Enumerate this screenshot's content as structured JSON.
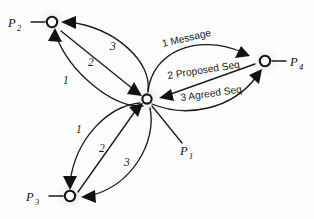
{
  "figure": {
    "background_color": "#fefefe",
    "stroke_color": "#1a1a1a",
    "node_fill_color": "#ffffff",
    "glow_color": "#d0d0d0"
  },
  "nodes": [
    {
      "id": "p1",
      "label": "P",
      "subscript": "1",
      "x": 147,
      "y": 99,
      "label_x": 186,
      "label_y": 152,
      "role": "sender-hub"
    },
    {
      "id": "p2",
      "label": "P",
      "subscript": "2",
      "x": 52,
      "y": 22,
      "label_x": 14,
      "label_y": 26,
      "role": "receiver"
    },
    {
      "id": "p3",
      "label": "P",
      "subscript": "3",
      "x": 70,
      "y": 196,
      "label_x": 32,
      "label_y": 200,
      "role": "receiver"
    },
    {
      "id": "p4",
      "label": "P",
      "subscript": "4",
      "x": 265,
      "y": 61,
      "label_x": 290,
      "label_y": 65,
      "role": "receiver"
    }
  ],
  "edges": [
    {
      "id": "e-p2-1",
      "label": "1",
      "from": "p1",
      "to": "p2",
      "label_x": 63,
      "label_y": 80,
      "group": "upper-left"
    },
    {
      "id": "e-p2-2",
      "label": "2",
      "from": "p2",
      "to": "p1",
      "label_x": 90,
      "label_y": 62,
      "group": "upper-left"
    },
    {
      "id": "e-p2-3",
      "label": "3",
      "from": "p1",
      "to": "p2",
      "label_x": 112,
      "label_y": 46,
      "group": "upper-left"
    },
    {
      "id": "e-p3-1",
      "label": "1",
      "from": "p1",
      "to": "p3",
      "label_x": 78,
      "label_y": 129,
      "group": "lower-left"
    },
    {
      "id": "e-p3-2",
      "label": "2",
      "from": "p3",
      "to": "p1",
      "label_x": 101,
      "label_y": 148,
      "group": "lower-left"
    },
    {
      "id": "e-p3-3",
      "label": "3",
      "from": "p1",
      "to": "p3",
      "label_x": 126,
      "label_y": 162,
      "group": "lower-left"
    },
    {
      "id": "e-p4-1",
      "label": "1 Message",
      "from": "p1",
      "to": "p4",
      "label_x": 163,
      "label_y": 47,
      "rotation": -13,
      "group": "right"
    },
    {
      "id": "e-p4-2",
      "label": "2 Proposed Seq",
      "from": "p4",
      "to": "p1",
      "label_x": 168,
      "label_y": 78,
      "rotation": -9,
      "group": "right"
    },
    {
      "id": "e-p4-3",
      "label": "3 Agreed Seq",
      "from": "p1",
      "to": "p4",
      "label_x": 180,
      "label_y": 100,
      "rotation": -8,
      "group": "right"
    }
  ],
  "legend_steps": [
    {
      "step": "1",
      "name": "Message"
    },
    {
      "step": "2",
      "name": "Proposed Seq"
    },
    {
      "step": "3",
      "name": "Agreed Seq"
    }
  ]
}
